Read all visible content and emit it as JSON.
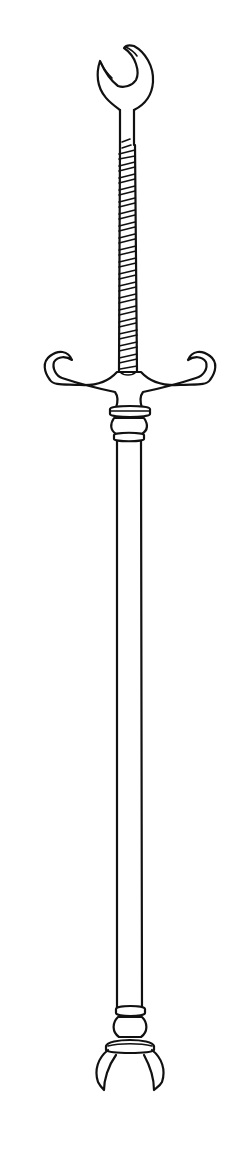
{
  "image": {
    "subject": "Line drawing of a pole weapon with forked head, spiral-wrapped upper shaft, hooked crossguard, long plain shaft and claw-shaped butt",
    "colors": {
      "background": "#ffffff",
      "ink": "#111111"
    },
    "parts": [
      "forked-head",
      "spiral-wrapped-grip",
      "hooked-crossguard",
      "collar-rings",
      "long-shaft",
      "lower-collar",
      "claw-butt"
    ]
  }
}
